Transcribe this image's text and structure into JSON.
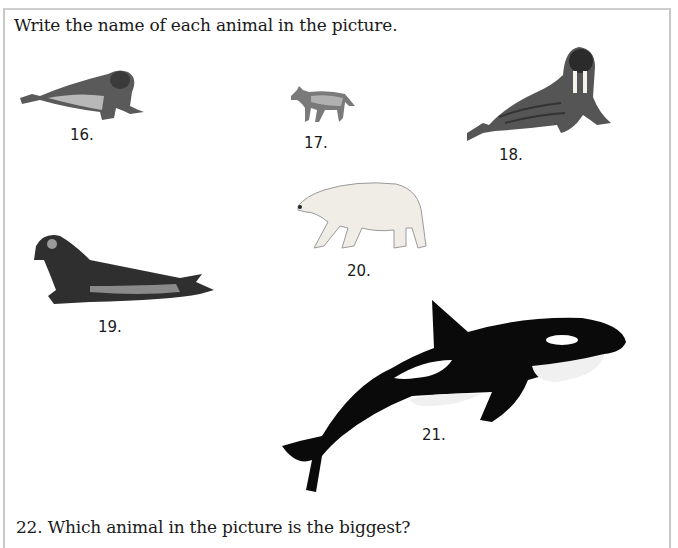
{
  "worksheet": {
    "instruction": "Write the name of each animal in the picture.",
    "question": "22. Which animal in the picture is the biggest?",
    "items": [
      {
        "number": "16.",
        "animal_icon": "elephant-seal-icon"
      },
      {
        "number": "17.",
        "animal_icon": "wolf-icon"
      },
      {
        "number": "18.",
        "animal_icon": "walrus-icon"
      },
      {
        "number": "19.",
        "animal_icon": "elephant-seal-icon"
      },
      {
        "number": "20.",
        "animal_icon": "polar-bear-icon"
      },
      {
        "number": "21.",
        "animal_icon": "orca-icon"
      }
    ]
  },
  "colors": {
    "text": "#1a1a1a",
    "border": "#c8c8c8",
    "orca_black": "#0a0a0a",
    "bear_white": "#f2f0ea"
  }
}
